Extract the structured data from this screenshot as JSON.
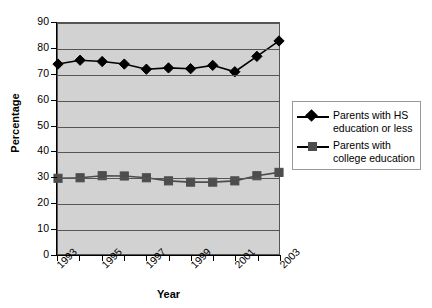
{
  "chart_data": {
    "type": "line",
    "title": "",
    "xlabel": "Year",
    "ylabel": "Percentage",
    "x": [
      1993,
      1994,
      1995,
      1996,
      1997,
      1998,
      1999,
      2000,
      2001,
      2002,
      2003
    ],
    "xtick_labels": [
      "1993",
      "",
      "1995",
      "",
      "1997",
      "",
      "1999",
      "",
      "2001",
      "",
      "2003"
    ],
    "xlim": [
      1993,
      2003
    ],
    "ylim": [
      0,
      90
    ],
    "ytick_labels": [
      "0",
      "10",
      "20",
      "30",
      "40",
      "50",
      "60",
      "70",
      "80",
      "90"
    ],
    "yticks": [
      0,
      10,
      20,
      30,
      40,
      50,
      60,
      70,
      80,
      90
    ],
    "grid": "horizontal",
    "legend_position": "right",
    "plot_background": "#d2d2d2",
    "series": [
      {
        "name": "Parents with HS education or less",
        "marker": "diamond",
        "color": "#000000",
        "values": [
          74,
          75.5,
          75,
          74,
          72,
          72.5,
          72.2,
          73.5,
          71,
          77,
          83
        ]
      },
      {
        "name": "Parents with college education",
        "marker": "square",
        "color": "#4d4d4d",
        "values": [
          29.5,
          29.7,
          30.5,
          30.4,
          29.7,
          28.5,
          28,
          28,
          28.5,
          30.5,
          31.8
        ]
      }
    ]
  },
  "legend": {
    "entries": [
      {
        "line1": "Parents with HS",
        "line2": "education or less"
      },
      {
        "line1": "Parents with",
        "line2": "college education"
      }
    ]
  },
  "axes": {
    "y_title": "Percentage",
    "x_title": "Year"
  }
}
